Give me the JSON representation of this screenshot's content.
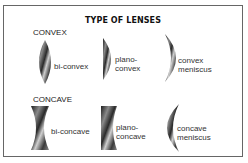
{
  "title": "TYPE OF LENSES",
  "sections": [
    {
      "heading": "CONVEX",
      "lenses": [
        {
          "name": "bi-convex",
          "line1": "bi-convex",
          "line2": ""
        },
        {
          "name": "plano-convex",
          "line1": "plano-",
          "line2": "convex"
        },
        {
          "name": "convex-meniscus",
          "line1": "convex",
          "line2": "meniscus"
        }
      ]
    },
    {
      "heading": "CONCAVE",
      "lenses": [
        {
          "name": "bi-concave",
          "line1": "bi-concave",
          "line2": ""
        },
        {
          "name": "plano-concave",
          "line1": "plano-",
          "line2": "concave"
        },
        {
          "name": "concave-meniscus",
          "line1": "concave",
          "line2": "meniscus"
        }
      ]
    }
  ],
  "colors": {
    "lens_dark": "#2a2a2a",
    "lens_light": "#d0d0d0",
    "border": "#666666"
  }
}
